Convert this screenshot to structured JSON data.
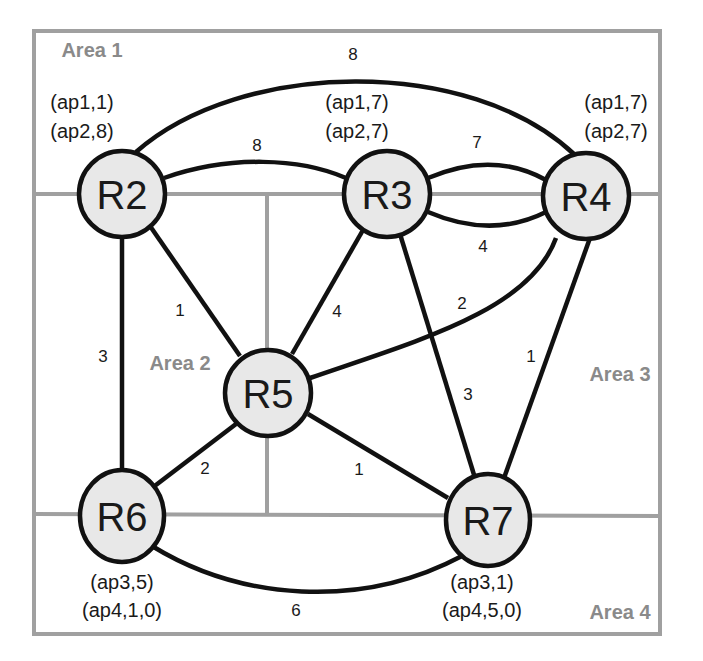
{
  "areas": [
    {
      "id": "area1",
      "label": "Area 1",
      "x": 92,
      "y": 50
    },
    {
      "id": "area2",
      "label": "Area 2",
      "x": 180,
      "y": 363
    },
    {
      "id": "area3",
      "label": "Area 3",
      "x": 620,
      "y": 374
    },
    {
      "id": "area4",
      "label": "Area 4",
      "x": 620,
      "y": 612
    }
  ],
  "nodes": [
    {
      "id": "R2",
      "label": "R2",
      "cx": 122,
      "cy": 194,
      "ap": [
        "(ap1,1)",
        "(ap2,8)"
      ],
      "ap_x": 82,
      "ap_y": [
        102,
        131
      ]
    },
    {
      "id": "R3",
      "label": "R3",
      "cx": 387,
      "cy": 194,
      "ap": [
        "(ap1,7)",
        "(ap2,7)"
      ],
      "ap_x": 355,
      "ap_y": [
        102,
        131
      ]
    },
    {
      "id": "R4",
      "label": "R4",
      "cx": 586,
      "cy": 196,
      "ap": [
        "(ap1,7)",
        "(ap2,7)"
      ],
      "ap_x": 615,
      "ap_y": [
        102,
        131
      ]
    },
    {
      "id": "R5",
      "label": "R5",
      "cx": 268,
      "cy": 393,
      "ap": [],
      "ap_x": 0,
      "ap_y": []
    },
    {
      "id": "R6",
      "label": "R6",
      "cx": 122,
      "cy": 516,
      "ap": [
        "(ap3,5)",
        "(ap4,1,0)"
      ],
      "ap_x": 122,
      "ap_y": 0
    },
    {
      "id": "R7",
      "label": "R7",
      "cx": 488,
      "cy": 520,
      "ap": [
        "(ap3,1)",
        "(ap4,5,0)"
      ],
      "ap_x": 488,
      "ap_y": 0
    }
  ],
  "ap_labels": {
    "R2": {
      "line1": "(ap1,1)",
      "line2": "(ap2,8)"
    },
    "R3": {
      "line1": "(ap1,7)",
      "line2": "(ap2,7)"
    },
    "R4": {
      "line1": "(ap1,7)",
      "line2": "(ap2,7)"
    },
    "R6": {
      "line1": "(ap3,5)",
      "line2": "(ap4,1,0)"
    },
    "R7": {
      "line1": "(ap3,1)",
      "line2": "(ap4,5,0)"
    }
  },
  "links": [
    {
      "from": "R2",
      "to": "R4",
      "weight": "8",
      "curve": "top-arc"
    },
    {
      "from": "R2",
      "to": "R3",
      "weight": "8",
      "curve": "arc-up"
    },
    {
      "from": "R3",
      "to": "R4",
      "weight": "7",
      "curve": "arc-up"
    },
    {
      "from": "R3",
      "to": "R4",
      "weight": "4",
      "curve": "arc-down"
    },
    {
      "from": "R2",
      "to": "R5",
      "weight": "1"
    },
    {
      "from": "R2",
      "to": "R6",
      "weight": "3"
    },
    {
      "from": "R3",
      "to": "R5",
      "weight": "4"
    },
    {
      "from": "R3",
      "to": "R7",
      "weight": "3"
    },
    {
      "from": "R4",
      "to": "R5",
      "weight": "2",
      "curve": "arc"
    },
    {
      "from": "R4",
      "to": "R7",
      "weight": "1"
    },
    {
      "from": "R5",
      "to": "R6",
      "weight": "2"
    },
    {
      "from": "R5",
      "to": "R7",
      "weight": "1"
    },
    {
      "from": "R6",
      "to": "R7",
      "weight": "6",
      "curve": "bottom-arc"
    }
  ],
  "weights": {
    "R2_R4_top": "8",
    "R2_R3": "8",
    "R3_R4_upper": "7",
    "R3_R4_lower": "4",
    "R2_R5": "1",
    "R2_R6": "3",
    "R3_R5": "4",
    "R3_R7": "3",
    "R4_R5": "2",
    "R4_R7": "1",
    "R5_R6": "2",
    "R5_R7": "1",
    "R6_R7": "6"
  },
  "colors": {
    "area_border": "#a0a0a0",
    "area_label": "#8a8a8a",
    "node_fill": "#e8e8e8",
    "link": "#111111"
  }
}
